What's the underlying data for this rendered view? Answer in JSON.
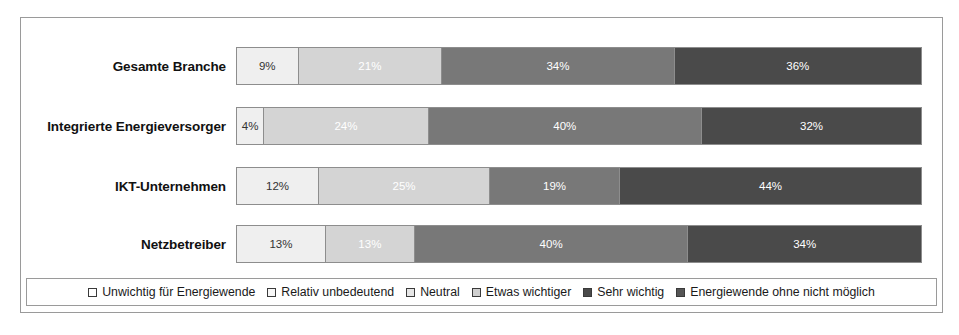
{
  "chart_data": {
    "type": "bar",
    "orientation": "horizontal",
    "stacked": true,
    "stack_mode": "percent",
    "title": "",
    "xlabel": "",
    "ylabel": "",
    "xlim": [
      0,
      100
    ],
    "grid": false,
    "legend_position": "bottom",
    "categories": [
      "Gesamte Branche",
      "Integrierte Energieversorger",
      "IKT-Unternehmen",
      "Netzbetreiber"
    ],
    "series": [
      {
        "name": "Unwichtig für Energiewende",
        "color": "#efefef",
        "values": [
          0,
          0,
          0,
          0
        ]
      },
      {
        "name": "Relativ unbedeutend",
        "color": "#efefef",
        "values": [
          0,
          0,
          0,
          0
        ]
      },
      {
        "name": "Neutral",
        "color": "#efefef",
        "values": [
          9,
          4,
          12,
          13
        ]
      },
      {
        "name": "Etwas wichtiger",
        "color": "#d4d4d4",
        "values": [
          21,
          24,
          25,
          13
        ]
      },
      {
        "name": "Sehr wichtig",
        "color": "#787878",
        "values": [
          34,
          40,
          19,
          40
        ]
      },
      {
        "name": "Energiewende ohne nicht möglich",
        "color": "#4a4a4a",
        "values": [
          36,
          32,
          44,
          34
        ]
      }
    ],
    "rows": [
      {
        "label": "Gesamte Branche",
        "segments": [
          {
            "label": "9%",
            "value": 9,
            "color_class": "c0"
          },
          {
            "label": "21%",
            "value": 21,
            "color_class": "c1"
          },
          {
            "label": "34%",
            "value": 34,
            "color_class": "c2"
          },
          {
            "label": "36%",
            "value": 36,
            "color_class": "c3"
          }
        ]
      },
      {
        "label": "Integrierte Energieversorger",
        "segments": [
          {
            "label": "4%",
            "value": 4,
            "color_class": "c0"
          },
          {
            "label": "24%",
            "value": 24,
            "color_class": "c1"
          },
          {
            "label": "40%",
            "value": 40,
            "color_class": "c2"
          },
          {
            "label": "32%",
            "value": 32,
            "color_class": "c3"
          }
        ]
      },
      {
        "label": "IKT-Unternehmen",
        "segments": [
          {
            "label": "12%",
            "value": 12,
            "color_class": "c0"
          },
          {
            "label": "25%",
            "value": 25,
            "color_class": "c1"
          },
          {
            "label": "19%",
            "value": 19,
            "color_class": "c2"
          },
          {
            "label": "44%",
            "value": 44,
            "color_class": "c3"
          }
        ]
      },
      {
        "label": "Netzbetreiber",
        "segments": [
          {
            "label": "13%",
            "value": 13,
            "color_class": "c0"
          },
          {
            "label": "13%",
            "value": 13,
            "color_class": "c1"
          },
          {
            "label": "40%",
            "value": 40,
            "color_class": "c2"
          },
          {
            "label": "34%",
            "value": 34,
            "color_class": "c3"
          }
        ]
      }
    ],
    "legend": [
      {
        "label": "Unwichtig für Energiewende",
        "swatch_class": "s0"
      },
      {
        "label": "Relativ unbedeutend",
        "swatch_class": "s1"
      },
      {
        "label": "Neutral",
        "swatch_class": "s2"
      },
      {
        "label": "Etwas wichtiger",
        "swatch_class": "s3"
      },
      {
        "label": "Sehr wichtig",
        "swatch_class": "s4"
      },
      {
        "label": "Energiewende ohne nicht möglich",
        "swatch_class": "s5"
      }
    ]
  }
}
